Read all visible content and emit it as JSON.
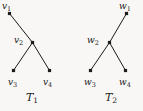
{
  "figure": {
    "background_color": "#f8f7f5",
    "ink_color": "#1b1b1b",
    "trees": [
      {
        "caption": "T",
        "caption_sub": "1",
        "caption_x": 26,
        "caption_y": 92,
        "nodes": [
          {
            "id": "v1",
            "letter": "v",
            "sub": "1",
            "cx": 9.5,
            "cy": 13.5,
            "label_x": 2,
            "label_y": 2,
            "label_anchor": "left"
          },
          {
            "id": "v2",
            "letter": "v",
            "sub": "2",
            "cx": 32.5,
            "cy": 42.5,
            "label_x": 14,
            "label_y": 36,
            "label_anchor": "left"
          },
          {
            "id": "v3",
            "letter": "v",
            "sub": "3",
            "cx": 13.5,
            "cy": 70.5,
            "label_x": 8,
            "label_y": 78,
            "label_anchor": "left"
          },
          {
            "id": "v4",
            "letter": "v",
            "sub": "4",
            "cx": 49.5,
            "cy": 70.5,
            "label_x": 43,
            "label_y": 78,
            "label_anchor": "left"
          }
        ],
        "edges": [
          {
            "from": "v1",
            "to": "v2"
          },
          {
            "from": "v2",
            "to": "v3"
          },
          {
            "from": "v2",
            "to": "v4"
          }
        ]
      },
      {
        "caption": "T",
        "caption_sub": "2",
        "caption_x": 105,
        "caption_y": 92,
        "nodes": [
          {
            "id": "w1",
            "letter": "w",
            "sub": "1",
            "cx": 126.5,
            "cy": 13.5,
            "label_x": 119,
            "label_y": 2,
            "label_anchor": "left"
          },
          {
            "id": "w2",
            "letter": "w",
            "sub": "2",
            "cx": 109.5,
            "cy": 42.5,
            "label_x": 87,
            "label_y": 36,
            "label_anchor": "left"
          },
          {
            "id": "w3",
            "letter": "w",
            "sub": "3",
            "cx": 90.5,
            "cy": 70.5,
            "label_x": 84,
            "label_y": 78,
            "label_anchor": "left"
          },
          {
            "id": "w4",
            "letter": "w",
            "sub": "4",
            "cx": 125.5,
            "cy": 70.5,
            "label_x": 119,
            "label_y": 78,
            "label_anchor": "left"
          }
        ],
        "edges": [
          {
            "from": "w1",
            "to": "w2"
          },
          {
            "from": "w2",
            "to": "w3"
          },
          {
            "from": "w2",
            "to": "w4"
          }
        ]
      }
    ]
  }
}
